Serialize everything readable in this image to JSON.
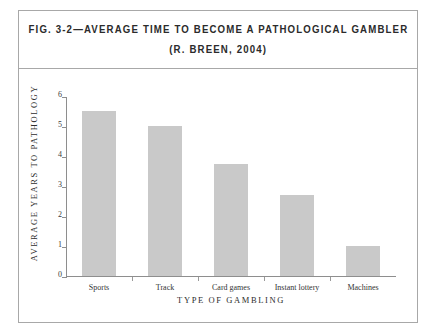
{
  "figure": {
    "title": "FIG. 3-2—AVERAGE TIME TO BECOME A PATHOLOGICAL GAMBLER",
    "subtitle": "(R. BREEN, 2004)"
  },
  "chart_data": {
    "type": "bar",
    "title": "FIG. 3-2—AVERAGE TIME TO BECOME A PATHOLOGICAL GAMBLER",
    "subtitle": "(R. BREEN, 2004)",
    "categories": [
      "Sports",
      "Track",
      "Card games",
      "Instant lottery",
      "Machines"
    ],
    "values": [
      5.5,
      5.0,
      3.75,
      2.7,
      1.0
    ],
    "xlabel": "TYPE OF GAMBLING",
    "ylabel": "AVERAGE YEARS TO PATHOLOGY",
    "ylim": [
      0,
      6
    ],
    "yticks": [
      0,
      1,
      2,
      3,
      4,
      5,
      6
    ],
    "ytick_labels": [
      "0",
      "1",
      "2",
      "3",
      "4",
      "5",
      "6"
    ],
    "grid": false,
    "legend": null,
    "bar_color": "#c9c9c9",
    "axis_color": "#8e8e8e",
    "frame_color": "#a8a8a8"
  }
}
